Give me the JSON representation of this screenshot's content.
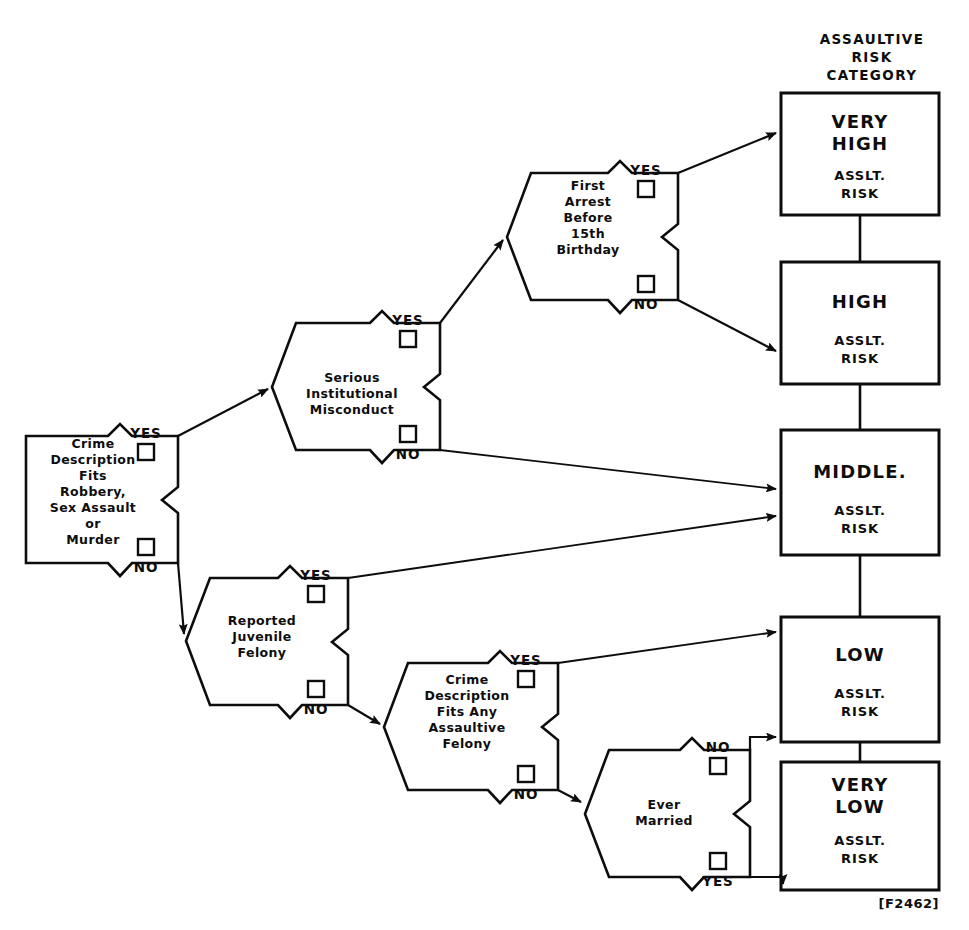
{
  "figure": {
    "caption": "[F2462]",
    "column_header": [
      "ASSAULTIVE",
      "RISK",
      "CATEGORY"
    ]
  },
  "decision_nodes": [
    {
      "id": "crime-robbery",
      "lines": [
        "Crime",
        "Description",
        "Fits",
        "Robbery,",
        "Sex  Assault",
        "or",
        "Murder"
      ],
      "branches": [
        {
          "label": "YES",
          "position": "top"
        },
        {
          "label": "NO",
          "position": "bottom"
        }
      ]
    },
    {
      "id": "serious-misconduct",
      "lines": [
        "Serious",
        "Institutional",
        "Misconduct"
      ],
      "branches": [
        {
          "label": "YES",
          "position": "top"
        },
        {
          "label": "NO",
          "position": "bottom"
        }
      ]
    },
    {
      "id": "first-arrest",
      "lines": [
        "First",
        "Arrest",
        "Before",
        "15th",
        "Birthday"
      ],
      "branches": [
        {
          "label": "YES",
          "position": "top"
        },
        {
          "label": "NO",
          "position": "bottom"
        }
      ]
    },
    {
      "id": "juvenile-felony",
      "lines": [
        "Reported",
        "Juvenile",
        "Felony"
      ],
      "branches": [
        {
          "label": "YES",
          "position": "top"
        },
        {
          "label": "NO",
          "position": "bottom"
        }
      ]
    },
    {
      "id": "assaultive-felony",
      "lines": [
        "Crime",
        "Description",
        "Fits Any",
        "Assaultive",
        "Felony"
      ],
      "branches": [
        {
          "label": "YES",
          "position": "top"
        },
        {
          "label": "NO",
          "position": "bottom"
        }
      ]
    },
    {
      "id": "ever-married",
      "lines": [
        "Ever",
        "Married"
      ],
      "branches": [
        {
          "label": "NO",
          "position": "top"
        },
        {
          "label": "YES",
          "position": "bottom"
        }
      ]
    }
  ],
  "outcomes": [
    {
      "id": "very-high",
      "title_lines": [
        "VERY",
        "HIGH"
      ],
      "sub_lines": [
        "ASSLT.",
        "RISK"
      ]
    },
    {
      "id": "high",
      "title_lines": [
        "HIGH"
      ],
      "sub_lines": [
        "ASSLT.",
        "RISK"
      ]
    },
    {
      "id": "middle",
      "title_lines": [
        "MIDDLE."
      ],
      "sub_lines": [
        "ASSLT.",
        "RISK"
      ]
    },
    {
      "id": "low",
      "title_lines": [
        "LOW"
      ],
      "sub_lines": [
        "ASSLT.",
        "RISK"
      ]
    },
    {
      "id": "very-low",
      "title_lines": [
        "VERY",
        "LOW"
      ],
      "sub_lines": [
        "ASSLT.",
        "RISK"
      ]
    }
  ],
  "colors": {
    "ink": "#0d0d0d",
    "paper": "#ffffff"
  }
}
